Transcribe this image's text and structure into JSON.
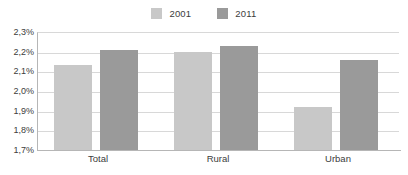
{
  "chart_data": {
    "type": "bar",
    "title": "",
    "subtitle": "",
    "xlabel": "",
    "ylabel": "",
    "categories": [
      "Total",
      "Rural",
      "Urban"
    ],
    "series": [
      {
        "name": "2001",
        "color": "#c8c8c8",
        "values": [
          2.13,
          2.2,
          1.92
        ]
      },
      {
        "name": "2011",
        "color": "#9a9a9a",
        "values": [
          2.21,
          2.23,
          2.16
        ]
      }
    ],
    "ylim": [
      1.7,
      2.3
    ],
    "ytick_values": [
      2.3,
      2.2,
      2.1,
      2.0,
      1.9,
      1.8,
      1.7
    ],
    "ytick_labels": [
      "2,3%",
      "2,2%",
      "2,1%",
      "2,0%",
      "1,9%",
      "1,8%",
      "1,7%"
    ],
    "grid": true,
    "grid_axis": "y",
    "legend_position": "top-center",
    "value_format": "percent",
    "decimal_separator": ","
  },
  "legend": {
    "entries": [
      {
        "label": "2001",
        "swatch_name": "legend-swatch-2001"
      },
      {
        "label": "2011",
        "swatch_name": "legend-swatch-2011"
      }
    ]
  },
  "colors": {
    "series_2001": "#c8c8c8",
    "series_2011": "#9a9a9a",
    "gridline": "#d8d8d8",
    "axis": "#b6b6b6",
    "text": "#3c3c3c",
    "background": "#ffffff"
  }
}
